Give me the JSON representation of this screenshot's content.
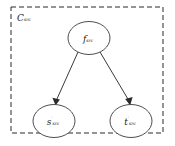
{
  "figure": {
    "type": "directed-graph",
    "container": {
      "label_base": "C",
      "label_sub": "src",
      "style": "dashed",
      "x": 11,
      "y": 7,
      "width": 152,
      "height": 126
    },
    "nodes": [
      {
        "id": "f-node",
        "base": "f",
        "sup": "",
        "sub": "src",
        "cx": 89,
        "cy": 38,
        "rx": 21,
        "ry": 16.5
      },
      {
        "id": "s-node",
        "base": "s",
        "sup": "′",
        "sub": "src",
        "cx": 54,
        "cy": 121,
        "rx": 21,
        "ry": 16.5
      },
      {
        "id": "t-node",
        "base": "t",
        "sup": "′",
        "sub": "src",
        "cx": 131,
        "cy": 121,
        "rx": 21,
        "ry": 16.5
      }
    ],
    "edges": [
      {
        "id": "edge-f-to-s",
        "from": "f-node",
        "to": "s-node",
        "arrow": true
      },
      {
        "id": "edge-f-to-t",
        "from": "f-node",
        "to": "t-node",
        "arrow": true
      }
    ],
    "colors": {
      "stroke": "#3a3a3a",
      "dashed_stroke": "#2b2b2b",
      "node_fill": "#ffffff",
      "background": "#ffffff",
      "text": "#1a1a1a"
    }
  }
}
